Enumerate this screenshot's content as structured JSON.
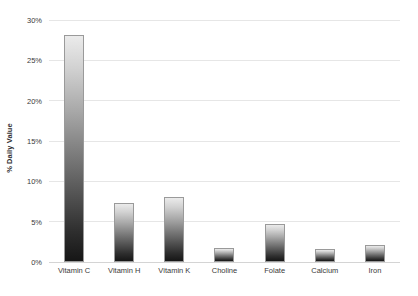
{
  "chart_data": {
    "type": "bar",
    "title": "",
    "subtitle": "",
    "xlabel": "",
    "ylabel": "% Daily Value",
    "categories": [
      "Vitamin C",
      "Vitamin H",
      "Vitamin K",
      "Choline",
      "Folate",
      "Calcium",
      "Iron"
    ],
    "values": [
      28.2,
      7.3,
      8.1,
      1.7,
      4.7,
      1.6,
      2.1
    ],
    "ylim": [
      0,
      30
    ],
    "ytick_labels": [
      "0%",
      "5%",
      "10%",
      "15%",
      "20%",
      "25%",
      "30%"
    ],
    "ytick_values": [
      0,
      5,
      10,
      15,
      20,
      25,
      30
    ],
    "grid": true,
    "legend": false,
    "legend_position": "none",
    "colors": {
      "bar_gradient_top": "#ebebeb",
      "bar_gradient_bottom": "#161616",
      "bar_outline": "#9a9a9a",
      "gridline": "#e6e6e6",
      "baseline": "#d4d4d4",
      "text": "#3a3a3a",
      "background": "#ffffff"
    }
  }
}
